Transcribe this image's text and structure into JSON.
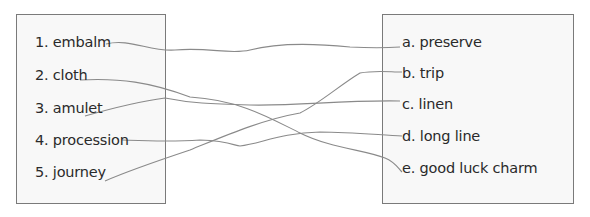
{
  "exercise": {
    "left_column": {
      "items": [
        {
          "number": "1.",
          "word": "embalm",
          "label": "1. embalm"
        },
        {
          "number": "2.",
          "word": "cloth",
          "label": "2. cloth"
        },
        {
          "number": "3.",
          "word": "amulet",
          "label": "3. amulet"
        },
        {
          "number": "4.",
          "word": "procession",
          "label": "4. procession"
        },
        {
          "number": "5.",
          "word": "journey",
          "label": "5. journey"
        }
      ]
    },
    "right_column": {
      "items": [
        {
          "letter": "a.",
          "meaning": "preserve",
          "label": "a. preserve"
        },
        {
          "letter": "b.",
          "meaning": "trip",
          "label": "b. trip"
        },
        {
          "letter": "c.",
          "meaning": "linen",
          "label": "c. linen"
        },
        {
          "letter": "d.",
          "meaning": "long line",
          "label": "d. long line"
        },
        {
          "letter": "e.",
          "meaning": "good luck charm",
          "label": "e. good luck charm"
        }
      ]
    },
    "matches": [
      {
        "from": "embalm",
        "to": "preserve"
      },
      {
        "from": "cloth",
        "to": "good luck charm"
      },
      {
        "from": "amulet",
        "to": "linen"
      },
      {
        "from": "procession",
        "to": "long line"
      },
      {
        "from": "journey",
        "to": "trip"
      }
    ],
    "colors": {
      "box_border": "#7a7a7a",
      "box_fill": "#f8f8f8",
      "line_stroke": "#8a8a8a",
      "text": "#2a2a2a"
    }
  }
}
